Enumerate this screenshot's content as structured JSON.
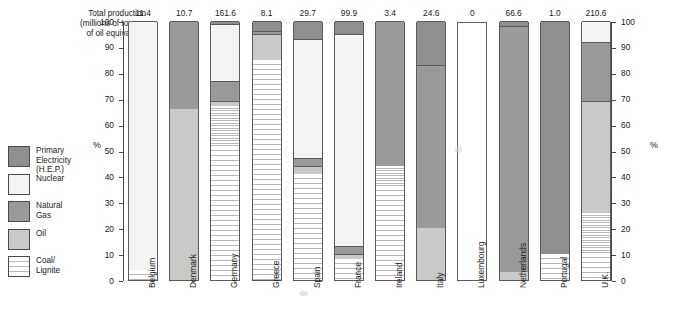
{
  "caption": {
    "line1": "Total production",
    "line2": "(millions of tonnes",
    "line3": "of oil equivalent)"
  },
  "axis": {
    "left_title": "%",
    "right_title": "%",
    "ticks": [
      "0",
      "10",
      "20",
      "30",
      "40",
      "50",
      "60",
      "70",
      "80",
      "90",
      "100"
    ]
  },
  "legend": {
    "items": [
      {
        "label": "Primary\nElectricity\n(H.E.P.)",
        "key": "primary_electricity",
        "color": "#8f8f8f",
        "swatch": "f-pe"
      },
      {
        "label": "Nuclear",
        "key": "nuclear",
        "color": "#f4f4f2",
        "swatch": "f-nu"
      },
      {
        "label": "Natural\nGas",
        "key": "natural_gas",
        "color": "#9a9a9a",
        "swatch": "f-ng"
      },
      {
        "label": "Oil",
        "key": "oil",
        "color": "#c9c9c7",
        "swatch": "f-oil"
      },
      {
        "label": "Coal/\nLignite",
        "key": "coal_lignite",
        "color": "#fdfdfc",
        "swatch": "f-coal"
      }
    ]
  },
  "chart_data": {
    "type": "bar",
    "title": "",
    "subtitle": "",
    "xlabel": "",
    "ylabel": "%",
    "ylim": [
      0,
      100
    ],
    "grid": false,
    "stacked": true,
    "legend_position": "left",
    "categories": [
      "Belgium",
      "Denmark",
      "Germany",
      "Greece",
      "Spain",
      "France",
      "Ireland",
      "Italy",
      "Luxembourg",
      "Netherlands",
      "Portugal",
      "U.K."
    ],
    "bar_labels": [
      "11.4",
      "10.7",
      "161.6",
      "8.1",
      "29.7",
      "99.9",
      "3.4",
      "24.6",
      "0",
      "66.6",
      "1.0",
      "210.6"
    ],
    "bar_label_meaning": "Total production (millions of tonnes of oil equivalent)",
    "series": [
      {
        "name": "Coal/Lignite",
        "values": [
          4,
          0,
          67,
          85,
          41,
          8,
          44,
          0,
          0,
          0,
          10,
          26
        ]
      },
      {
        "name": "Oil",
        "values": [
          0,
          66,
          2,
          10,
          3,
          2,
          0,
          20,
          0,
          3,
          0,
          43
        ]
      },
      {
        "name": "Natural Gas",
        "values": [
          0,
          34,
          8,
          1,
          3,
          3,
          56,
          63,
          0,
          95,
          0,
          23
        ]
      },
      {
        "name": "Nuclear",
        "values": [
          96,
          0,
          22,
          0,
          46,
          82,
          0,
          0,
          0,
          0,
          0,
          8
        ]
      },
      {
        "name": "Primary Electricity",
        "values": [
          0,
          0,
          1,
          4,
          7,
          5,
          0,
          17,
          0,
          2,
          90,
          0
        ]
      }
    ]
  }
}
